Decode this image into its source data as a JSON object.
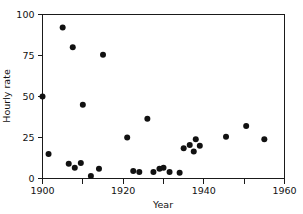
{
  "chart_data": {
    "type": "scatter",
    "title": "",
    "xlabel": "Year",
    "ylabel": "Hourly rate",
    "xlim": [
      1900,
      1960
    ],
    "ylim": [
      0,
      100
    ],
    "grid": false,
    "legend": "none",
    "x_ticks_major": [
      1900,
      1920,
      1940,
      1960
    ],
    "x_ticks_minor": [
      1910,
      1930,
      1950
    ],
    "x_tick_labels": [
      "1900",
      "1920",
      "1940",
      "1960"
    ],
    "y_ticks": [
      0,
      25,
      50,
      75,
      100
    ],
    "y_tick_labels": [
      "0",
      "25",
      "50",
      "75",
      "100"
    ],
    "marker": "filled-circle",
    "marker_color": "#111111",
    "marker_size": 3.0,
    "points": [
      {
        "x": 1900.0,
        "y": 50.0
      },
      {
        "x": 1901.5,
        "y": 15.0
      },
      {
        "x": 1905.0,
        "y": 92.0
      },
      {
        "x": 1906.5,
        "y": 9.0
      },
      {
        "x": 1907.5,
        "y": 80.0
      },
      {
        "x": 1908.0,
        "y": 6.5
      },
      {
        "x": 1909.5,
        "y": 9.5
      },
      {
        "x": 1910.0,
        "y": 45.0
      },
      {
        "x": 1912.0,
        "y": 1.5
      },
      {
        "x": 1914.0,
        "y": 6.0
      },
      {
        "x": 1915.0,
        "y": 75.5
      },
      {
        "x": 1921.0,
        "y": 25.0
      },
      {
        "x": 1922.5,
        "y": 4.5
      },
      {
        "x": 1924.0,
        "y": 4.0
      },
      {
        "x": 1926.0,
        "y": 36.5
      },
      {
        "x": 1927.5,
        "y": 4.0
      },
      {
        "x": 1929.0,
        "y": 6.0
      },
      {
        "x": 1930.0,
        "y": 6.5
      },
      {
        "x": 1931.5,
        "y": 4.0
      },
      {
        "x": 1934.0,
        "y": 3.5
      },
      {
        "x": 1935.0,
        "y": 18.5
      },
      {
        "x": 1936.5,
        "y": 20.5
      },
      {
        "x": 1937.5,
        "y": 16.5
      },
      {
        "x": 1938.0,
        "y": 24.0
      },
      {
        "x": 1939.0,
        "y": 20.0
      },
      {
        "x": 1945.5,
        "y": 25.5
      },
      {
        "x": 1950.5,
        "y": 32.0
      },
      {
        "x": 1955.0,
        "y": 24.0
      }
    ]
  },
  "axes": {
    "y_axis_label": "Hourly rate",
    "x_axis_label": "Year"
  }
}
